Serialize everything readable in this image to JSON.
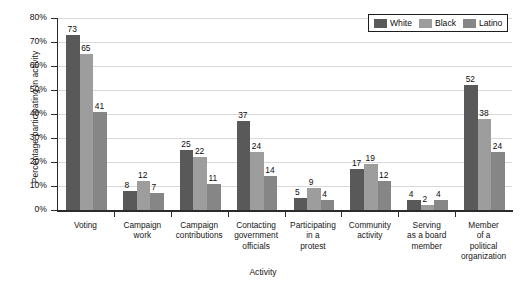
{
  "chart_data": {
    "type": "bar",
    "title": "",
    "xlabel": "Activity",
    "ylabel": "Percentage participating in activity",
    "ylim": [
      0,
      80
    ],
    "ytick_labels": [
      "0%",
      "10%",
      "20%",
      "30%",
      "40%",
      "50%",
      "60%",
      "70%",
      "80%"
    ],
    "ytick_values": [
      0,
      10,
      20,
      30,
      40,
      50,
      60,
      70,
      80
    ],
    "grid": true,
    "legend_position": "top-right",
    "categories": [
      "Voting",
      "Campaign work",
      "Campaign contributions",
      "Contacting government officials",
      "Participating in a protest",
      "Community activity",
      "Serving as a board member",
      "Member of a political organization"
    ],
    "category_lines": [
      [
        "Voting"
      ],
      [
        "Campaign",
        "work"
      ],
      [
        "Campaign",
        "contributions"
      ],
      [
        "Contacting",
        "government",
        "officials"
      ],
      [
        "Participating",
        "in a",
        "protest"
      ],
      [
        "Community",
        "activity"
      ],
      [
        "Serving",
        "as a board",
        "member"
      ],
      [
        "Member",
        "of a",
        "political",
        "organization"
      ]
    ],
    "series": [
      {
        "name": "White",
        "color": "#59595a",
        "values": [
          73,
          8,
          25,
          37,
          5,
          17,
          4,
          52
        ]
      },
      {
        "name": "Black",
        "color": "#9d9d9e",
        "values": [
          65,
          12,
          22,
          24,
          9,
          19,
          2,
          38
        ]
      },
      {
        "name": "Latino",
        "color": "#868687",
        "values": [
          41,
          7,
          11,
          14,
          4,
          12,
          4,
          24
        ]
      }
    ]
  }
}
